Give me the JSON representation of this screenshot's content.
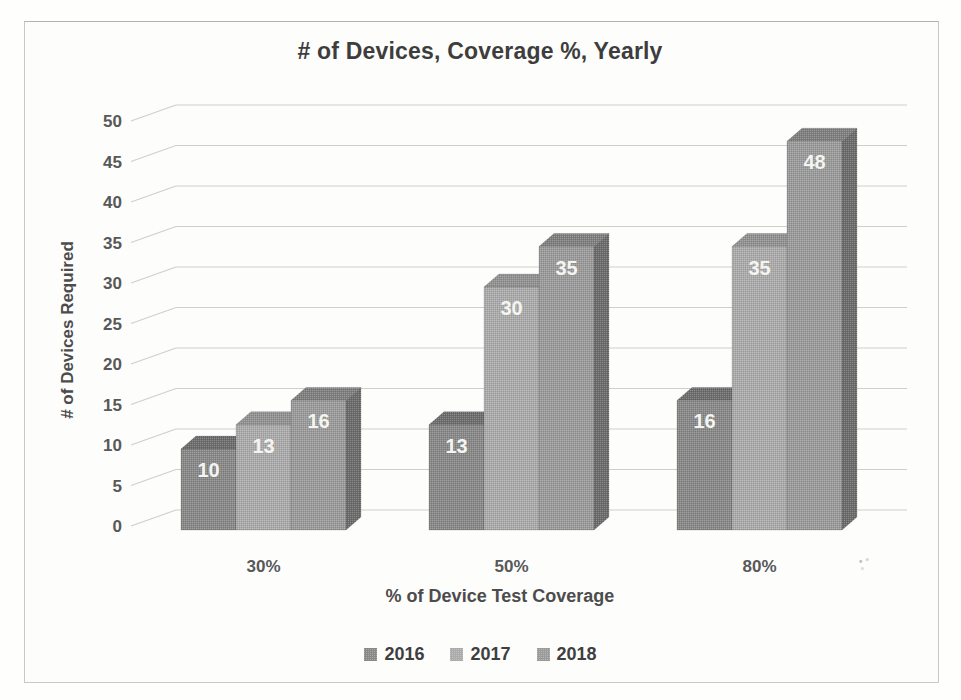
{
  "chart_data": {
    "type": "bar",
    "style": "3d-clustered-column-grayscale",
    "title": "# of Devices, Coverage %, Yearly",
    "xlabel": "% of Device Test Coverage",
    "ylabel": "# of Devices Required",
    "categories": [
      "30%",
      "50%",
      "80%"
    ],
    "series": [
      {
        "name": "2016",
        "values": [
          10,
          13,
          16
        ],
        "front": "#898989",
        "top": "#6e6e6e",
        "side": "#5a5a5a"
      },
      {
        "name": "2017",
        "values": [
          13,
          30,
          35
        ],
        "front": "#ababab",
        "top": "#929292",
        "side": "#7f7f7f"
      },
      {
        "name": "2018",
        "values": [
          16,
          35,
          48
        ],
        "front": "#9b9b9b",
        "top": "#808080",
        "side": "#6c6c6c"
      }
    ],
    "ylim": [
      0,
      50
    ],
    "ytick_step": 5,
    "yticks": [
      0,
      5,
      10,
      15,
      20,
      25,
      30,
      35,
      40,
      45,
      50
    ],
    "grid": true,
    "legend_position": "bottom",
    "data_labels": true,
    "data_label_color": "#f4f4f0",
    "gridline_color": "#cfcfcb",
    "tick_label_color": "#585858",
    "title_color": "#3d3d3d",
    "axis_label_color": "#4c4c4c"
  }
}
